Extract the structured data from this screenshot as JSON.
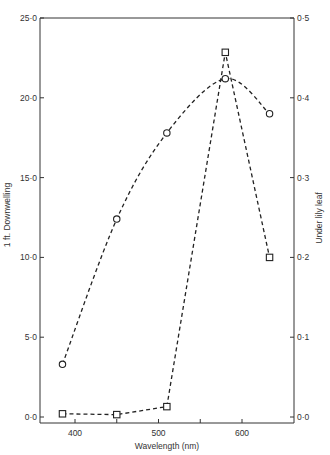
{
  "chart_data": {
    "type": "line",
    "title": "",
    "xlabel": "Wavelength (nm)",
    "ylabel_left": "1 ft. Downwelling",
    "ylabel_right": "Under lily leaf",
    "x_ticks": [
      400,
      500,
      600
    ],
    "x_minor_ticks": [
      450,
      550
    ],
    "xlim": [
      360,
      660
    ],
    "y_left_ticks": [
      "0·0",
      "5·0",
      "10·0",
      "15·0",
      "20·0",
      "25·0"
    ],
    "y_left_lim": [
      0,
      25
    ],
    "y_right_ticks": [
      "0·0",
      "0·1",
      "0·2",
      "0·3",
      "0·4",
      "0·5"
    ],
    "y_right_lim": [
      0,
      0.5
    ],
    "grid": false,
    "legend": "none",
    "series": [
      {
        "name": "1 ft. Downwelling",
        "axis": "left",
        "marker": "circle",
        "line": "dashed-smooth",
        "x": [
          385,
          450,
          510,
          580,
          633
        ],
        "values": [
          3.3,
          12.4,
          17.8,
          21.2,
          19.0
        ]
      },
      {
        "name": "Under lily leaf",
        "axis": "right",
        "marker": "square",
        "line": "dashed",
        "x": [
          385,
          450,
          510,
          580,
          633
        ],
        "values": [
          0.004,
          0.003,
          0.013,
          0.457,
          0.2
        ]
      }
    ]
  }
}
